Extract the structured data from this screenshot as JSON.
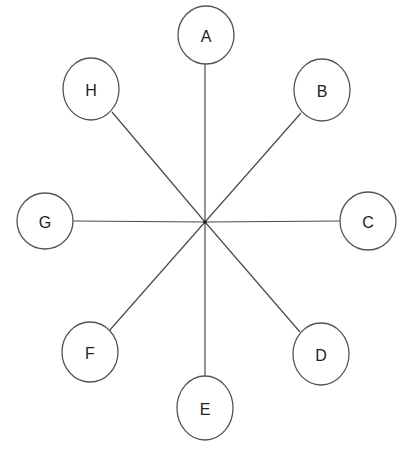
{
  "diagram": {
    "type": "star",
    "hub": {
      "x": 205,
      "y": 222
    },
    "colors": {
      "line": "#4a4a4a",
      "circle_stroke": "#555555",
      "text": "#222222",
      "background": "#ffffff"
    },
    "nodes": [
      {
        "id": "A",
        "label": "A",
        "cx": 206,
        "cy": 35,
        "rx": 28,
        "ry": 29,
        "line_end": {
          "x": 205,
          "y": 64
        }
      },
      {
        "id": "B",
        "label": "B",
        "cx": 322,
        "cy": 90,
        "rx": 28,
        "ry": 31,
        "line_end": {
          "x": 301,
          "y": 113
        }
      },
      {
        "id": "C",
        "label": "C",
        "cx": 368,
        "cy": 221,
        "rx": 28,
        "ry": 29,
        "line_end": {
          "x": 341,
          "y": 221
        }
      },
      {
        "id": "D",
        "label": "D",
        "cx": 321,
        "cy": 354,
        "rx": 28,
        "ry": 31,
        "line_end": {
          "x": 300,
          "y": 332
        }
      },
      {
        "id": "E",
        "label": "E",
        "cx": 205,
        "cy": 408,
        "rx": 28,
        "ry": 32,
        "line_end": {
          "x": 205,
          "y": 376
        }
      },
      {
        "id": "F",
        "label": "F",
        "cx": 90,
        "cy": 352,
        "rx": 28,
        "ry": 30,
        "line_end": {
          "x": 109,
          "y": 331
        }
      },
      {
        "id": "G",
        "label": "G",
        "cx": 45,
        "cy": 221,
        "rx": 28,
        "ry": 28,
        "line_end": {
          "x": 73,
          "y": 221
        }
      },
      {
        "id": "H",
        "label": "H",
        "cx": 91,
        "cy": 89,
        "rx": 28,
        "ry": 31,
        "line_end": {
          "x": 112,
          "y": 112
        }
      }
    ]
  }
}
